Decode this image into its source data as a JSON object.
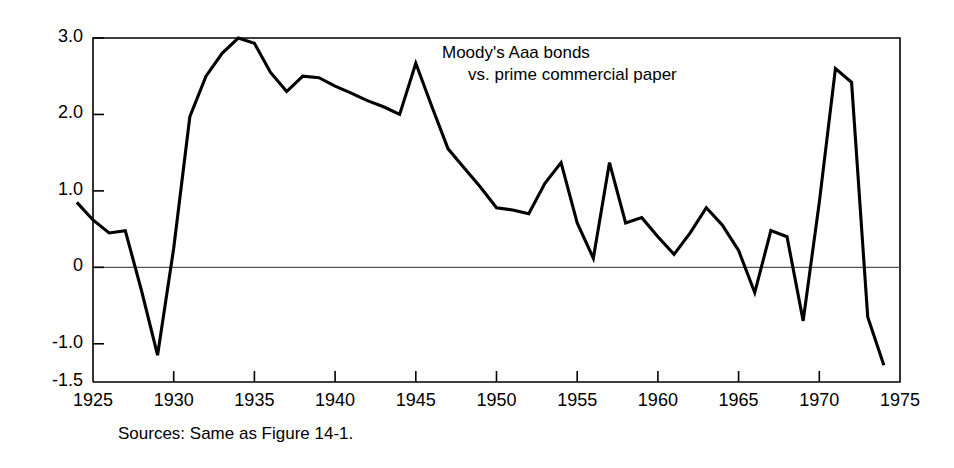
{
  "figure": {
    "ylabel": "Percentage differential",
    "source_note": "Sources: Same as Figure 14-1.",
    "annotation_line1": "Moody's Aaa bonds",
    "annotation_line2": "vs. prime commercial paper",
    "line_color": "#000000",
    "axis_color": "#000000",
    "zero_line_color": "#555555",
    "background": "#ffffff"
  },
  "chart_data": {
    "type": "line",
    "title": "",
    "subtitle": "",
    "xlabel": "",
    "ylabel": "Percentage differential",
    "annotations": [
      "Moody's Aaa bonds",
      "vs. prime commercial paper"
    ],
    "source": "Sources: Same as Figure 14-1.",
    "legend": [],
    "legend_position": "none",
    "grid": false,
    "xlim": [
      1925,
      1975
    ],
    "ylim": [
      -1.5,
      3.0
    ],
    "xticks": [
      1925,
      1930,
      1935,
      1940,
      1945,
      1950,
      1955,
      1960,
      1965,
      1970,
      1975
    ],
    "xtick_labels": [
      "1925",
      "1930",
      "1935",
      "1940",
      "1945",
      "1950",
      "1955",
      "1960",
      "1965",
      "1970",
      "1975"
    ],
    "yticks": [
      -1.5,
      -1.0,
      0,
      1.0,
      2.0,
      3.0
    ],
    "ytick_labels": [
      "-1.5",
      "-1.0",
      "0",
      "1.0",
      "2.0",
      "3.0"
    ],
    "series": [
      {
        "name": "Moody's Aaa bonds vs. prime commercial paper",
        "x": [
          1924,
          1925,
          1926,
          1927,
          1928,
          1929,
          1930,
          1931,
          1932,
          1933,
          1934,
          1935,
          1936,
          1937,
          1938,
          1939,
          1940,
          1941,
          1942,
          1943,
          1944,
          1945,
          1946,
          1947,
          1948,
          1949,
          1950,
          1951,
          1952,
          1953,
          1954,
          1955,
          1956,
          1957,
          1958,
          1959,
          1960,
          1961,
          1962,
          1963,
          1964,
          1965,
          1966,
          1967,
          1968,
          1969,
          1970,
          1971,
          1972,
          1973,
          1974
        ],
        "values": [
          0.85,
          0.62,
          0.45,
          0.48,
          -0.3,
          -1.15,
          0.25,
          1.97,
          2.5,
          2.8,
          3.0,
          2.93,
          2.55,
          2.3,
          2.5,
          2.48,
          2.37,
          2.28,
          2.18,
          2.1,
          2.0,
          2.67,
          2.1,
          1.55,
          1.3,
          1.05,
          0.78,
          0.75,
          0.7,
          1.1,
          1.37,
          0.58,
          0.12,
          1.37,
          0.58,
          0.65,
          0.4,
          0.17,
          0.45,
          0.78,
          0.55,
          0.22,
          -0.33,
          0.48,
          0.4,
          -0.7,
          0.85,
          2.6,
          2.42,
          -0.65,
          -1.28
        ]
      }
    ]
  }
}
